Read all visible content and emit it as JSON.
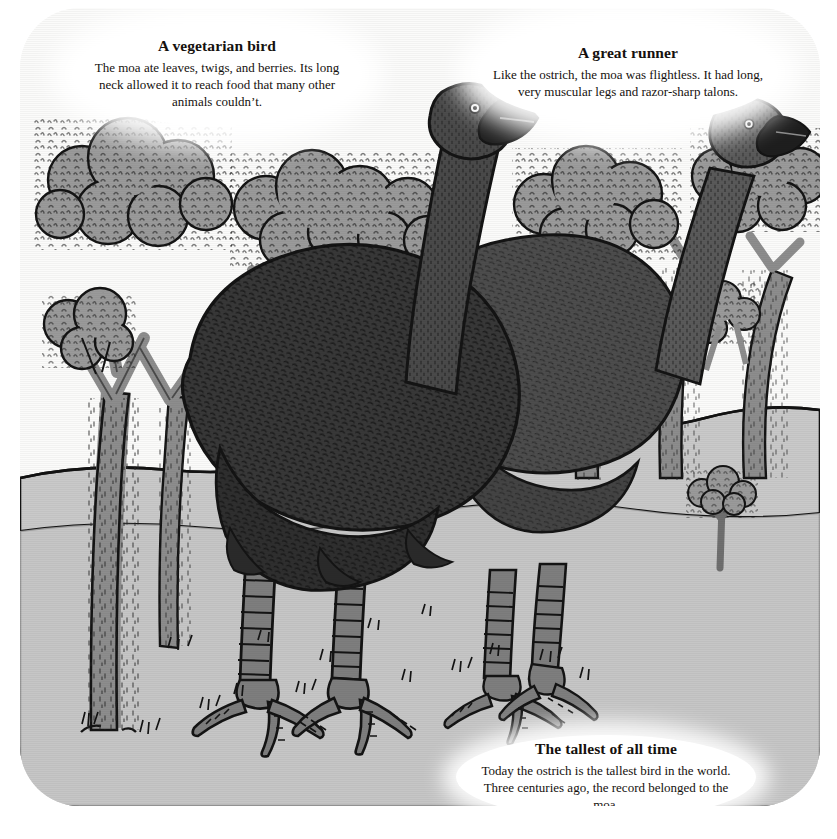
{
  "illustration": {
    "subject": "Two giant moa birds standing among trees",
    "palette": {
      "sky": "#fbfbfa",
      "ground": "#c9c9c9",
      "hill": "#c2c2c2",
      "foliage": "#9a9a9a",
      "trunk": "#8d8d8d",
      "moa_body_dark": "#383838",
      "moa_body_light": "#4d4d4d",
      "moa_leg": "#7e7e7e",
      "ink": "#141414",
      "callout_fill": "#ffffff"
    }
  },
  "callouts": [
    {
      "id": "vegetarian-bird",
      "title": "A vegetarian bird",
      "body": "The moa ate leaves, twigs, and berries. Its long neck allowed it to reach food that many other animals couldn’t."
    },
    {
      "id": "great-runner",
      "title": "A great runner",
      "body": "Like the ostrich, the moa was flightless. It had long, very muscular legs and razor-sharp talons."
    },
    {
      "id": "tallest-of-all-time",
      "title": "The tallest of all time",
      "body": "Today the ostrich is the tallest bird in the world. Three centuries ago, the record belonged to the moa."
    }
  ]
}
